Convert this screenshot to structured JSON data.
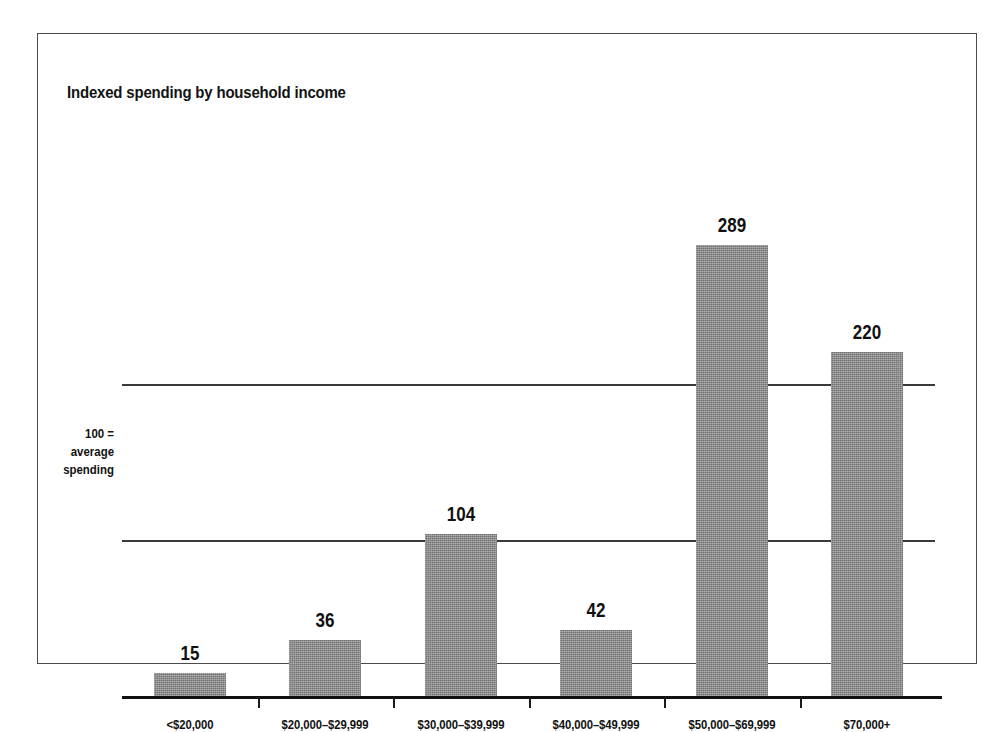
{
  "figure": {
    "title": "Indexed spending by household income",
    "axis_note_lines": [
      "100 =",
      "average",
      "spending"
    ],
    "frame_color": "#4a4a4a",
    "bar_color": "#8d8d8d",
    "text_color": "#111111",
    "background": "#ffffff"
  },
  "chart_data": {
    "type": "bar",
    "title": "Indexed spending by household income",
    "xlabel": "",
    "ylabel": "100 = average spending",
    "categories": [
      "<$20,000",
      "$20,000–$29,999",
      "$30,000–$39,999",
      "$40,000–$49,999",
      "$50,000–$69,999",
      "$70,000+"
    ],
    "values": [
      15,
      36,
      104,
      42,
      289,
      220
    ],
    "value_labels": [
      "15",
      "36",
      "104",
      "42",
      "289",
      "220"
    ],
    "ylim": [
      0,
      320
    ],
    "gridlines": [
      100,
      200
    ],
    "grid": true,
    "legend": "none",
    "annotations": [
      "100 = average spending"
    ]
  }
}
